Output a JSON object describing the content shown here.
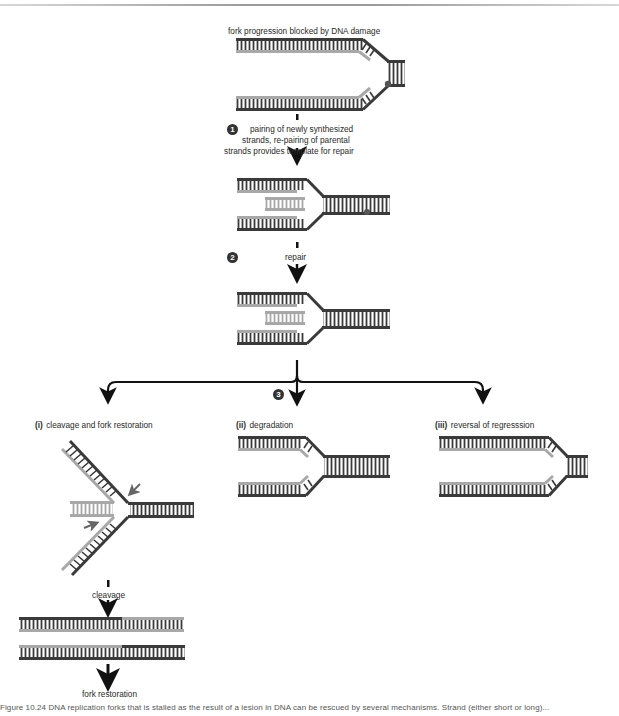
{
  "figure": {
    "top_label": "fork progression blocked by DNA damage",
    "steps": [
      {
        "number": "1",
        "text_lines": [
          "pairing of newly synthesized",
          "strands, re-pairing of parental",
          "strands provides template for repair"
        ]
      },
      {
        "number": "2",
        "text_lines": [
          "repair"
        ]
      },
      {
        "number": "3",
        "text_lines": []
      }
    ],
    "branches": [
      {
        "numeral": "(i)",
        "label": "cleavage and fork restoration",
        "sub_steps": [
          "cleavage",
          "fork restoration"
        ]
      },
      {
        "numeral": "(ii)",
        "label": "degradation"
      },
      {
        "numeral": "(iii)",
        "label": "reversal of regresssion"
      }
    ],
    "colors": {
      "parental_strand": "#3a3a3a",
      "new_strand": "#a8a8a8",
      "arrow": "#111111",
      "small_arrow": "#666666",
      "damage_dot": "#555555"
    },
    "caption": "Figure 10.24 DNA replication forks that is stalled as the result of a lesion in DNA can be rescued by several mechanisms. Strand (either short or long)..."
  }
}
